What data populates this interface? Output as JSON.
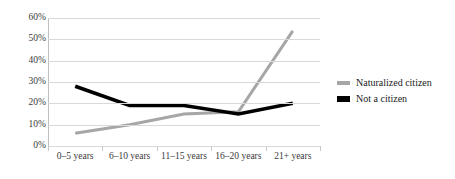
{
  "chart_data": {
    "type": "line",
    "title": "",
    "xlabel": "",
    "ylabel": "",
    "categories": [
      "0–5 years",
      "6–10 years",
      "11–15 years",
      "16–20 years",
      "21+ years"
    ],
    "ylim": [
      0,
      60
    ],
    "ytick_labels": [
      "0%",
      "10%",
      "20%",
      "30%",
      "40%",
      "50%",
      "60%"
    ],
    "ytick_values": [
      0,
      10,
      20,
      30,
      40,
      50,
      60
    ],
    "grid": true,
    "legend_position": "right",
    "series": [
      {
        "name": "Naturalized citizen",
        "color": "#a6a6a6",
        "values": [
          6,
          10,
          15,
          16,
          54
        ]
      },
      {
        "name": "Not a citizen",
        "color": "#000000",
        "values": [
          28,
          19,
          19,
          15,
          20
        ]
      }
    ]
  },
  "legend": {
    "items": [
      {
        "label": "Naturalized citizen",
        "color": "#a6a6a6"
      },
      {
        "label": "Not a citizen",
        "color": "#000000"
      }
    ]
  }
}
